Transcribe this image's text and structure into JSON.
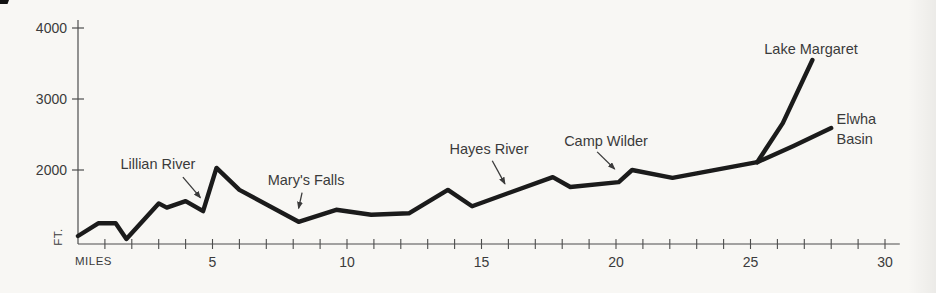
{
  "page": {
    "kind": "elevation-profile-chart",
    "background": "#f8f7f4",
    "scan_artifact": "black corner mark top-left"
  },
  "colors": {
    "profile_line": "#1b1b1b",
    "axis_line": "#4d4d4d",
    "text": "#3b3b3b",
    "background": "#f8f7f4"
  },
  "chart_data": {
    "type": "line",
    "title": "",
    "xlabel": "MILES",
    "ylabel": "FT.",
    "xlim": [
      0,
      30.55
    ],
    "ylim": [
      958,
      4113
    ],
    "grid": false,
    "legend": "none",
    "x_minor_tick_interval": 1,
    "x_major_ticks": [
      {
        "value": 5,
        "label": "5"
      },
      {
        "value": 10,
        "label": "10"
      },
      {
        "value": 15,
        "label": "15"
      },
      {
        "value": 20,
        "label": "20"
      },
      {
        "value": 25,
        "label": "25"
      },
      {
        "value": 30,
        "label": "30"
      }
    ],
    "y_ticks": [
      {
        "value": 2000,
        "label": "2000"
      },
      {
        "value": 3000,
        "label": "3000"
      },
      {
        "value": 4000,
        "label": "4000"
      }
    ],
    "series": [
      {
        "name": "main-trail",
        "units": [
          "mile",
          "ft"
        ],
        "points": [
          [
            0.0,
            1070
          ],
          [
            0.75,
            1250
          ],
          [
            1.4,
            1250
          ],
          [
            1.8,
            1030
          ],
          [
            3.0,
            1530
          ],
          [
            3.3,
            1470
          ],
          [
            4.0,
            1560
          ],
          [
            4.65,
            1420
          ],
          [
            5.15,
            2030
          ],
          [
            6.0,
            1720
          ],
          [
            8.2,
            1270
          ],
          [
            9.6,
            1440
          ],
          [
            10.9,
            1370
          ],
          [
            12.3,
            1390
          ],
          [
            13.75,
            1720
          ],
          [
            14.65,
            1490
          ],
          [
            17.65,
            1900
          ],
          [
            18.3,
            1760
          ],
          [
            20.1,
            1830
          ],
          [
            20.6,
            2000
          ],
          [
            22.1,
            1890
          ],
          [
            25.25,
            2110
          ]
        ]
      },
      {
        "name": "lake-margaret-branch",
        "units": [
          "mile",
          "ft"
        ],
        "points": [
          [
            25.25,
            2110
          ],
          [
            26.2,
            2660
          ],
          [
            27.3,
            3550
          ]
        ]
      },
      {
        "name": "elwha-basin-branch",
        "units": [
          "mile",
          "ft"
        ],
        "points": [
          [
            25.25,
            2110
          ],
          [
            26.6,
            2340
          ],
          [
            28.0,
            2590
          ]
        ]
      }
    ],
    "annotations": [
      {
        "label": "Lillian River",
        "anchor": "middle",
        "text_at": [
          2.97,
          2085
        ],
        "arrow": {
          "from": [
            3.9,
            1900
          ],
          "to": [
            4.55,
            1610
          ]
        }
      },
      {
        "label": "Mary's Falls",
        "anchor": "middle",
        "text_at": [
          8.48,
          1855
        ],
        "arrow": {
          "from": [
            8.33,
            1680
          ],
          "to": [
            8.2,
            1460
          ]
        }
      },
      {
        "label": "Hayes River",
        "anchor": "middle",
        "text_at": [
          15.28,
          2295
        ],
        "arrow": {
          "from": [
            15.4,
            2130
          ],
          "to": [
            15.87,
            1805
          ]
        }
      },
      {
        "label": "Camp Wilder",
        "anchor": "middle",
        "text_at": [
          19.63,
          2410
        ],
        "arrow": {
          "from": [
            19.3,
            2255
          ],
          "to": [
            19.95,
            2015
          ]
        }
      },
      {
        "label": "Lake Margaret",
        "anchor": "middle",
        "text_at": [
          27.25,
          3700
        ]
      },
      {
        "label": "Elwha Basin",
        "lines": [
          "Elwha",
          "Basin"
        ],
        "anchor": "start",
        "text_at": [
          28.2,
          2715
        ]
      }
    ]
  }
}
